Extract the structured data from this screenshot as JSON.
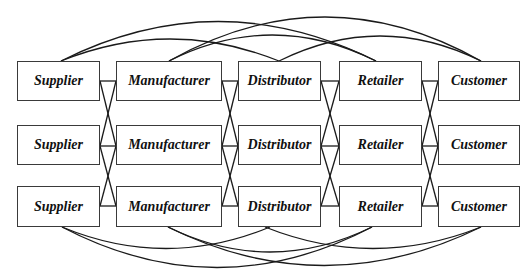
{
  "diagram": {
    "type": "supply-chain-network",
    "stages": [
      "Supplier",
      "Manufacturer",
      "Distributor",
      "Retailer",
      "Customer"
    ],
    "rows": 3,
    "nodes": [
      {
        "id": "r1c1",
        "label": "Supplier",
        "row": 1,
        "col": 1
      },
      {
        "id": "r1c2",
        "label": "Manufacturer",
        "row": 1,
        "col": 2
      },
      {
        "id": "r1c3",
        "label": "Distributor",
        "row": 1,
        "col": 3
      },
      {
        "id": "r1c4",
        "label": "Retailer",
        "row": 1,
        "col": 4
      },
      {
        "id": "r1c5",
        "label": "Customer",
        "row": 1,
        "col": 5
      },
      {
        "id": "r2c1",
        "label": "Supplier",
        "row": 2,
        "col": 1
      },
      {
        "id": "r2c2",
        "label": "Manufacturer",
        "row": 2,
        "col": 2
      },
      {
        "id": "r2c3",
        "label": "Distributor",
        "row": 2,
        "col": 3
      },
      {
        "id": "r2c4",
        "label": "Retailer",
        "row": 2,
        "col": 4
      },
      {
        "id": "r2c5",
        "label": "Customer",
        "row": 2,
        "col": 5
      },
      {
        "id": "r3c1",
        "label": "Supplier",
        "row": 3,
        "col": 1
      },
      {
        "id": "r3c2",
        "label": "Manufacturer",
        "row": 3,
        "col": 2
      },
      {
        "id": "r3c3",
        "label": "Distributor",
        "row": 3,
        "col": 3
      },
      {
        "id": "r3c4",
        "label": "Retailer",
        "row": 3,
        "col": 4
      },
      {
        "id": "r3c5",
        "label": "Customer",
        "row": 3,
        "col": 5
      }
    ],
    "edges": {
      "adjacent_same_row": "each node connects to the next-stage node in its own row",
      "adjacent_cross_row": "each node connects to next-stage nodes in neighboring rows (X crossings)",
      "top_arcs": [
        {
          "from": "r1c1",
          "to": "r1c3"
        },
        {
          "from": "r1c1",
          "to": "r1c4"
        },
        {
          "from": "r1c2",
          "to": "r1c4"
        },
        {
          "from": "r1c2",
          "to": "r1c5"
        },
        {
          "from": "r1c3",
          "to": "r1c5"
        }
      ],
      "bottom_arcs": [
        {
          "from": "r3c1",
          "to": "r3c3"
        },
        {
          "from": "r3c1",
          "to": "r3c4"
        },
        {
          "from": "r3c2",
          "to": "r3c4"
        },
        {
          "from": "r3c2",
          "to": "r3c5"
        },
        {
          "from": "r3c3",
          "to": "r3c5"
        }
      ]
    }
  }
}
